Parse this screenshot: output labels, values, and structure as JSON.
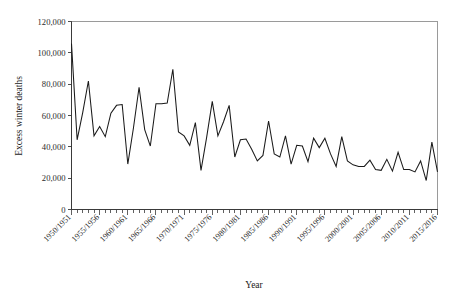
{
  "chart_data": {
    "type": "line",
    "title": "",
    "xlabel": "Year",
    "ylabel": "Excess winter deaths",
    "ylim": [
      0,
      120000
    ],
    "ytick_labels": [
      "0",
      "20,000",
      "40,000",
      "60,000",
      "80,000",
      "100,000",
      "120,000"
    ],
    "ytick_values": [
      0,
      20000,
      40000,
      60000,
      80000,
      100000,
      120000
    ],
    "grid": false,
    "legend": "none",
    "xtick_labels": [
      "1950/1951",
      "1955/1956",
      "1960/1961",
      "1965/1966",
      "1970/1971",
      "1975/1976",
      "1980/1981",
      "1985/1986",
      "1990/1991",
      "1995/1996",
      "2000/2001",
      "2005/2006",
      "2010/2011",
      "2015/2016"
    ],
    "xtick_indices": [
      0,
      5,
      10,
      15,
      20,
      25,
      30,
      35,
      40,
      45,
      50,
      55,
      60,
      65
    ],
    "categories": [
      "1950/1951",
      "1951/1952",
      "1952/1953",
      "1953/1954",
      "1954/1955",
      "1955/1956",
      "1956/1957",
      "1957/1958",
      "1958/1959",
      "1959/1960",
      "1960/1961",
      "1961/1962",
      "1962/1963",
      "1963/1964",
      "1964/1965",
      "1965/1966",
      "1966/1967",
      "1967/1968",
      "1968/1969",
      "1969/1970",
      "1970/1971",
      "1971/1972",
      "1972/1973",
      "1973/1974",
      "1974/1975",
      "1975/1976",
      "1976/1977",
      "1977/1978",
      "1978/1979",
      "1979/1980",
      "1980/1981",
      "1981/1982",
      "1982/1983",
      "1983/1984",
      "1984/1985",
      "1985/1986",
      "1986/1987",
      "1987/1988",
      "1988/1989",
      "1989/1990",
      "1990/1991",
      "1991/1992",
      "1992/1993",
      "1993/1994",
      "1994/1995",
      "1995/1996",
      "1996/1997",
      "1997/1998",
      "1998/1999",
      "1999/2000",
      "2000/2001",
      "2001/2002",
      "2002/2003",
      "2003/2004",
      "2004/2005",
      "2005/2006",
      "2006/2007",
      "2007/2008",
      "2008/2009",
      "2009/2010",
      "2010/2011",
      "2011/2012",
      "2012/2013",
      "2013/2014",
      "2014/2015",
      "2015/2016"
    ],
    "values": [
      106000,
      44500,
      62000,
      82000,
      47000,
      53000,
      46500,
      61500,
      66500,
      67000,
      29000,
      52000,
      78000,
      51000,
      40500,
      67500,
      67500,
      68000,
      89500,
      49500,
      47000,
      41000,
      55500,
      25000,
      46000,
      69000,
      47000,
      56000,
      66500,
      33500,
      44500,
      45000,
      38500,
      31000,
      34500,
      56500,
      35500,
      33500,
      47000,
      29000,
      41000,
      40500,
      30500,
      45500,
      39500,
      45500,
      35500,
      27500,
      46500,
      31000,
      28500,
      27500,
      27500,
      31500,
      25500,
      25000,
      32000,
      24500,
      36500,
      25500,
      25500,
      24000,
      31000,
      18500,
      43000,
      24000
    ],
    "series_name": "Excess winter deaths"
  },
  "figure": {
    "caption": ""
  }
}
